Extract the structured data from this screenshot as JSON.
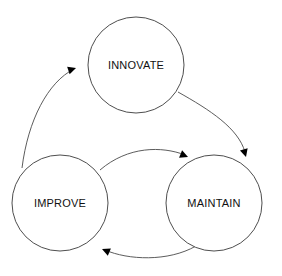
{
  "diagram": {
    "type": "cycle-diagram",
    "background_color": "#ffffff",
    "stroke_color": "#3a3a3a",
    "arrow_color": "#000000",
    "label_color": "#111111",
    "nodes": [
      {
        "id": "innovate",
        "label": "INNOVATE",
        "cx": 136,
        "cy": 65,
        "r": 48
      },
      {
        "id": "improve",
        "label": "IMPROVE",
        "cx": 60,
        "cy": 203,
        "r": 48
      },
      {
        "id": "maintain",
        "label": "MAINTAIN",
        "cx": 214,
        "cy": 203,
        "r": 48
      }
    ],
    "links": [
      {
        "id": "improve-to-innovate",
        "from": "improve",
        "to": "innovate",
        "path": "M 22,168 C 28,120 48,82 74,69",
        "arrow_x": 76,
        "arrow_y": 68,
        "arrow_rotation": -18
      },
      {
        "id": "innovate-to-maintain",
        "from": "innovate",
        "to": "maintain",
        "path": "M 178,92 C 210,110 238,128 245,152",
        "arrow_x": 246,
        "arrow_y": 157,
        "arrow_rotation": 74
      },
      {
        "id": "improve-to-maintain",
        "from": "improve",
        "to": "maintain",
        "path": "M 100,170 C 128,146 162,146 185,155",
        "arrow_x": 188,
        "arrow_y": 157,
        "arrow_rotation": 22
      },
      {
        "id": "maintain-to-improve",
        "from": "maintain",
        "to": "improve",
        "path": "M 196,246 C 168,262 128,260 105,250",
        "arrow_x": 102,
        "arrow_y": 249,
        "arrow_rotation": 203
      }
    ]
  }
}
